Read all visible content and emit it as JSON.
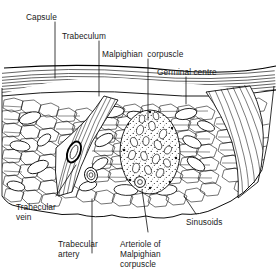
{
  "figure": {
    "background_color": "#ffffff",
    "ink_color": "#000000",
    "width": 277,
    "height": 277
  },
  "labels": {
    "capsule": "Capsule",
    "trabeculum": "Trabeculum",
    "malpighian_corpuscle": "Malpighian  corpuscle",
    "germinal_centre": "Germinal centre",
    "trabecular_vein_l1": "Trabecular",
    "trabecular_vein_l2": "vein",
    "trabecular_artery_l1": "Trabecular",
    "trabecular_artery_l2": "artery",
    "arteriole_l1": "Arteriole of",
    "arteriole_l2": "Malpighian",
    "arteriole_l3": "corpuscle",
    "sinusoids": "Sinusoids"
  },
  "structures": {
    "capsule_layer": "capsule-fibrous-band",
    "trabeculum_left": "trabeculum-left",
    "trabeculum_right": "trabeculum-right",
    "malpighian_corpuscle": "malpighian-corpuscle",
    "germinal_centre": "germinal-centre-stipple",
    "trabecular_vein": "trabecular-vein-lumen",
    "trabecular_artery": "trabecular-artery-lumen",
    "arteriole": "arteriole-lumen",
    "red_pulp": "red-pulp-cell-mesh",
    "sinusoids": "sinusoid-lacunae"
  }
}
